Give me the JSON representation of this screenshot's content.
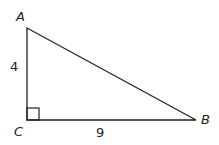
{
  "diagram": {
    "type": "right-triangle",
    "vertices": {
      "A": {
        "label": "A",
        "x": 27,
        "y": 28
      },
      "C": {
        "label": "C",
        "x": 27,
        "y": 120
      },
      "B": {
        "label": "B",
        "x": 196,
        "y": 120
      }
    },
    "sides": {
      "AC": {
        "label": "4"
      },
      "CB": {
        "label": "9"
      }
    },
    "right_angle_at": "C",
    "stroke_color": "#222222"
  }
}
